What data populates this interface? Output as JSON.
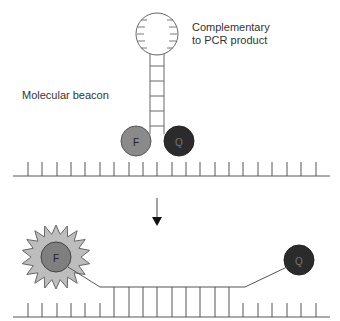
{
  "diagram": {
    "labels": {
      "loop_line1": "Complementary",
      "loop_line2": "to PCR product",
      "beacon": "Molecular beacon"
    },
    "fluorophore_letter": "F",
    "quencher_letter": "Q",
    "colors": {
      "line": "#555555",
      "fluorophore_fill": "#8a8a8a",
      "fluorophore_emit_fill": "#7f7f7f",
      "quencher_fill": "#2b2b2b",
      "starburst_fill": "#bdbdbd",
      "text": "#333333"
    },
    "states": [
      {
        "name": "hairpin",
        "description": "Beacon in hairpin form; F and Q adjacent (quenched)"
      },
      {
        "name": "hybridized",
        "description": "Beacon bound to PCR product; F separated from Q (fluorescent)"
      }
    ]
  }
}
